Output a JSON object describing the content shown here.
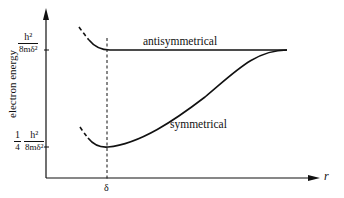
{
  "diagram": {
    "type": "energy-level plot",
    "y_axis": {
      "label": "electron energy",
      "ticks": [
        {
          "numerator": "h²",
          "denominator": "8mδ²",
          "prefix": ""
        },
        {
          "prefix_num": "1",
          "prefix_den": "4",
          "numerator": "h²",
          "denominator": "8mδ²"
        }
      ]
    },
    "x_axis": {
      "label": "r",
      "tick": "δ"
    },
    "curves": [
      {
        "name": "antisymmetrical",
        "label": "antisymmetrical"
      },
      {
        "name": "symmetrical",
        "label": "symmetrical"
      }
    ],
    "colors": {
      "ink": "#111111",
      "background": "#ffffff"
    }
  }
}
